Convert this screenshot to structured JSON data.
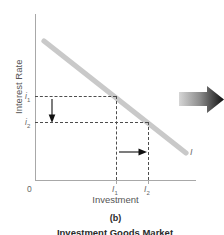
{
  "figure": {
    "panel_letter": "(b)",
    "caption": "Investment Goods Market",
    "axes": {
      "y_title": "Interest Rate",
      "x_title": "Investment",
      "origin_label": "0"
    },
    "ticks": {
      "y": [
        {
          "id": "i1",
          "label": "i",
          "sub": "1",
          "value_px_y": 96
        },
        {
          "id": "i2",
          "label": "i",
          "sub": "2",
          "value_px_y": 122
        }
      ],
      "x": [
        {
          "id": "I1",
          "label": "I",
          "sub": "1",
          "value_px_x": 116
        },
        {
          "id": "I2",
          "label": "I",
          "sub": "2",
          "value_px_x": 148
        }
      ]
    },
    "curves": [
      {
        "id": "investment-demand",
        "label": "I",
        "color": "#c9c9c9"
      }
    ],
    "annotations": [
      {
        "id": "interest-rate-fall-arrow",
        "direction": "down",
        "meaning": "interest rate falls from i1 to i2"
      },
      {
        "id": "investment-rise-arrow",
        "direction": "right",
        "meaning": "investment rises from I1 to I2"
      },
      {
        "id": "shift-arrow",
        "direction": "right",
        "meaning": "large block arrow pointing right"
      }
    ],
    "colors": {
      "curve": "#c9c9c9",
      "axis": "#a8a8a8",
      "dash": "#4d4d4d",
      "text": "#555555",
      "arrow_dark": "#121212",
      "arrow_light": "#d0d0d0"
    }
  }
}
